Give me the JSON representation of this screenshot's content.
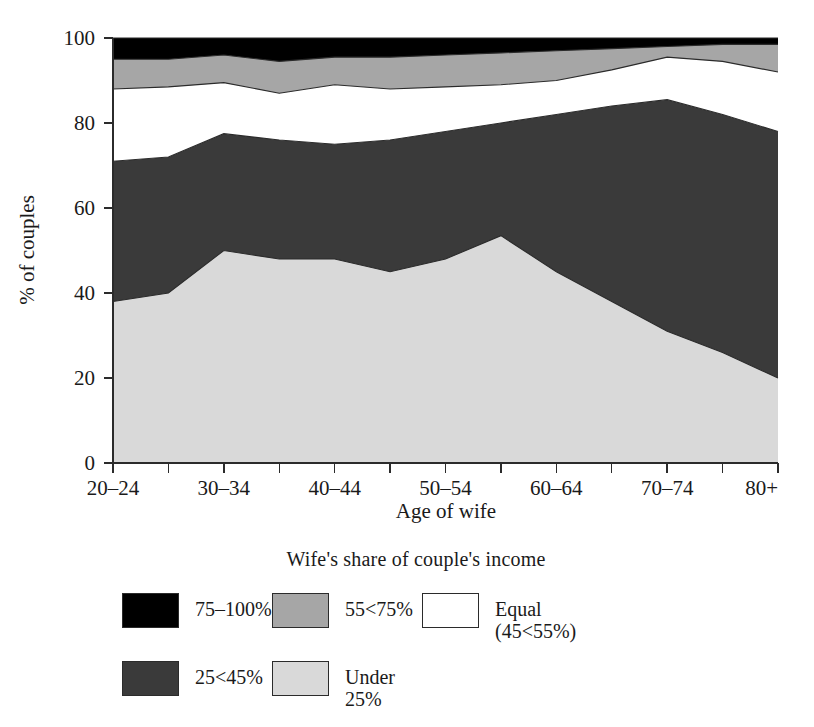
{
  "chart_data": {
    "type": "area",
    "stacked": true,
    "title": "",
    "xlabel": "Age of wife",
    "ylabel": "% of couples",
    "ylim": [
      0,
      100
    ],
    "yticks": [
      0,
      20,
      40,
      60,
      80,
      100
    ],
    "grid": false,
    "legend_position": "bottom",
    "legend_title": "Wife's share of couple's income",
    "categories": [
      "20–24",
      "25–29",
      "30–34",
      "35–39",
      "40–44",
      "45–49",
      "50–54",
      "55–59",
      "60–64",
      "65–69",
      "70–74",
      "75–79",
      "80+"
    ],
    "tick_labels_visible": [
      "20–24",
      "",
      "30–34",
      "",
      "40–44",
      "",
      "50–54",
      "",
      "60–64",
      "",
      "70–74",
      "",
      "80+"
    ],
    "series": [
      {
        "name": "Under 25%",
        "color": "#d9d9d9",
        "values": [
          38,
          40,
          50,
          48,
          48,
          45,
          48,
          53.5,
          45,
          38,
          31,
          26,
          20
        ]
      },
      {
        "name": "25<45%",
        "color": "#3a3a3a",
        "values": [
          33,
          32,
          27.5,
          28,
          27,
          31,
          30,
          26.5,
          37,
          46,
          54.5,
          56,
          58
        ]
      },
      {
        "name": "Equal (45<55%)",
        "color": "#ffffff",
        "values": [
          17,
          16.5,
          12,
          11,
          14,
          12,
          10.5,
          9,
          8,
          8.5,
          10,
          12.5,
          14
        ]
      },
      {
        "name": "55<75%",
        "color": "#a6a6a6",
        "values": [
          7,
          6.5,
          6.5,
          7.5,
          6.5,
          7.5,
          7.5,
          7.5,
          7,
          5,
          2.5,
          4,
          6.5
        ]
      },
      {
        "name": "75–100%",
        "color": "#000000",
        "values": [
          5,
          5,
          4,
          5.5,
          4.5,
          4.5,
          4,
          3.5,
          3,
          2.5,
          2,
          1.5,
          1.5
        ]
      }
    ],
    "cumulative_boundaries": {
      "under_25_top": [
        38,
        40,
        50,
        48,
        48,
        45,
        48,
        53.5,
        45,
        38,
        31,
        26,
        20
      ],
      "band_25_45_top": [
        71,
        72,
        77.5,
        76,
        75,
        76,
        78,
        80,
        82,
        84,
        85.5,
        82,
        78
      ],
      "equal_top": [
        88,
        88.5,
        89.5,
        87,
        89,
        88,
        88.5,
        89,
        90,
        92.5,
        95.5,
        94.5,
        92
      ],
      "band_55_75_top": [
        95,
        95,
        96,
        94.5,
        95.5,
        95.5,
        96,
        96.5,
        97,
        97.5,
        98,
        98.5,
        98.5
      ],
      "top": [
        100,
        100,
        100,
        100,
        100,
        100,
        100,
        100,
        100,
        100,
        100,
        100,
        100
      ]
    }
  },
  "axes": {
    "y_label": "% of couples",
    "x_label": "Age of wife",
    "y_ticks": [
      "0",
      "20",
      "40",
      "60",
      "80",
      "100"
    ]
  },
  "legend": {
    "title": "Wife's share of couple's income",
    "entries": [
      {
        "label": "75–100%",
        "color": "#000000"
      },
      {
        "label": "55<75%",
        "color": "#a6a6a6"
      },
      {
        "label": "Equal\n(45<55%)",
        "color": "#ffffff"
      },
      {
        "label": "25<45%",
        "color": "#3a3a3a"
      },
      {
        "label": "Under 25%",
        "color": "#d9d9d9"
      }
    ]
  }
}
